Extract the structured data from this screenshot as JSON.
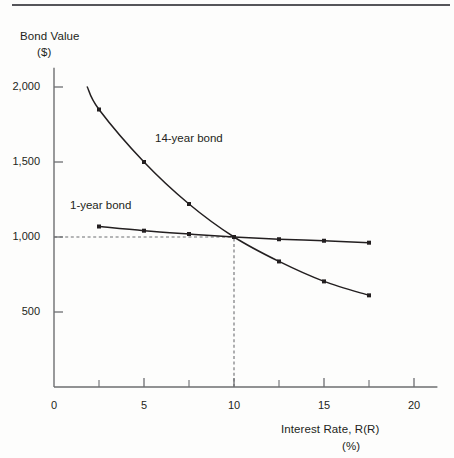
{
  "figure": {
    "has_top_rule": true,
    "background_color": "#fdfdfc",
    "ink_color": "#231f20"
  },
  "chart_data": {
    "type": "line",
    "title": "",
    "subtitle": "",
    "xlabel_line1": "Interest Rate, R(R)",
    "xlabel_line2": "(%)",
    "ylabel_line1": "Bond Value",
    "ylabel_line2": "($)",
    "xlim": [
      0,
      21.3
    ],
    "ylim": [
      0,
      2150
    ],
    "grid": false,
    "legend_position": "inline-annotations",
    "x_ticks_major": [
      0,
      5,
      10,
      15,
      20
    ],
    "x_ticks_major_labels": [
      "0",
      "5",
      "10",
      "15",
      "20"
    ],
    "x_ticks_minor": [
      2.5,
      7.5,
      12.5,
      17.5
    ],
    "y_ticks_major": [
      500,
      1000,
      1500,
      2000
    ],
    "y_ticks_major_labels": [
      "500",
      "1,000",
      "1,500",
      "2,000"
    ],
    "annotations": [
      {
        "text": "14-year bond",
        "x": 11.3,
        "y": 1660
      },
      {
        "text": "1-year bond",
        "x": 3.6,
        "y": 1255
      }
    ],
    "reference_lines": [
      {
        "type": "horizontal",
        "value": 1000,
        "style": "dashed",
        "from_x": 0,
        "to_x": 10
      },
      {
        "type": "vertical",
        "value": 10,
        "style": "dashed",
        "from_y": 0,
        "to_y": 1000
      }
    ],
    "intersection_point": {
      "x": 10,
      "y": 1000
    },
    "series": [
      {
        "name": "14-year bond",
        "marker": "square",
        "x": [
          1.85,
          2.5,
          5,
          7.5,
          10,
          12.5,
          15,
          17.5
        ],
        "values": [
          2000,
          1850,
          1500,
          1220,
          1000,
          837,
          704,
          611
        ]
      },
      {
        "name": "1-year bond",
        "marker": "square",
        "x": [
          2.5,
          5,
          7.5,
          10,
          12.5,
          15,
          17.5
        ],
        "values": [
          1070,
          1042,
          1020,
          1000,
          985,
          975,
          962
        ]
      }
    ]
  }
}
